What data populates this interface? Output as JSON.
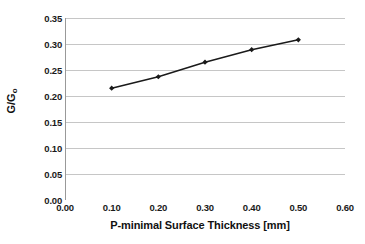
{
  "chart_data": {
    "type": "line",
    "title": "",
    "xlabel": "P-minimal Surface Thickness [mm]",
    "ylabel": "G/G",
    "ylabel_sub": "o",
    "x": [
      0.1,
      0.2,
      0.3,
      0.4,
      0.5
    ],
    "values": [
      0.215,
      0.237,
      0.265,
      0.289,
      0.308
    ],
    "series": [
      {
        "name": "G/Go",
        "x": [
          0.1,
          0.2,
          0.3,
          0.4,
          0.5
        ],
        "values": [
          0.215,
          0.237,
          0.265,
          0.289,
          0.308
        ]
      }
    ],
    "xlim": [
      0.0,
      0.6
    ],
    "ylim": [
      0.0,
      0.35
    ],
    "xticks": [
      0.0,
      0.1,
      0.2,
      0.3,
      0.4,
      0.5,
      0.6
    ],
    "yticks": [
      0.0,
      0.05,
      0.1,
      0.15,
      0.2,
      0.25,
      0.3,
      0.35
    ],
    "xtick_labels": [
      "0.00",
      "0.10",
      "0.20",
      "0.30",
      "0.40",
      "0.50",
      "0.60"
    ],
    "ytick_labels": [
      "0.00",
      "0.05",
      "0.10",
      "0.15",
      "0.20",
      "0.25",
      "0.30",
      "0.35"
    ],
    "grid": "horizontal",
    "legend": "none",
    "line_color": "#1a1a1a",
    "marker": "diamond",
    "marker_color": "#1a1a1a",
    "grid_color": "#b8b8b8",
    "axis_color": "#999999",
    "background": "#ffffff"
  }
}
